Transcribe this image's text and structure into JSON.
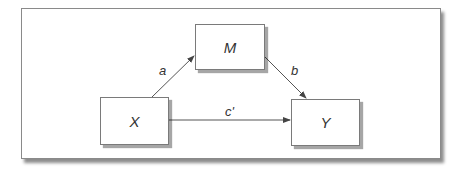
{
  "diagram": {
    "type": "mediation-path-diagram",
    "nodes": [
      {
        "id": "M",
        "label": "M"
      },
      {
        "id": "X",
        "label": "X"
      },
      {
        "id": "Y",
        "label": "Y"
      }
    ],
    "edges": [
      {
        "from": "X",
        "to": "M",
        "label": "a"
      },
      {
        "from": "M",
        "to": "Y",
        "label": "b"
      },
      {
        "from": "X",
        "to": "Y",
        "label": "c'"
      }
    ],
    "colors": {
      "border": "#7a7a7a",
      "line": "#555555",
      "text": "#333333",
      "background": "#ffffff"
    }
  }
}
